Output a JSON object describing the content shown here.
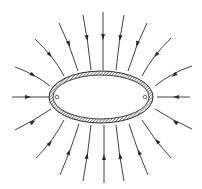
{
  "diagram": {
    "ellipse": {
      "cx": 101,
      "cy": 97,
      "rx": 52,
      "ry": 26,
      "shell_thickness": 4,
      "fill": "hatched"
    },
    "markers": [
      {
        "name": "left-point",
        "x": 57,
        "y": 97
      },
      {
        "name": "right-point",
        "x": 145,
        "y": 97
      }
    ],
    "field_lines": [
      {
        "name": "top-1",
        "d": "M15 67 Q35 74 50 86",
        "arrow": [
          33,
          75,
          35
        ]
      },
      {
        "name": "top-2",
        "d": "M35 39 Q55 58 64 76",
        "arrow": [
          50,
          55,
          50
        ]
      },
      {
        "name": "top-3",
        "d": "M59 23 Q70 45 78 71",
        "arrow": [
          69,
          44,
          68
        ]
      },
      {
        "name": "top-4",
        "d": "M83 15 Q88 40 91 70",
        "arrow": [
          87,
          38,
          80
        ]
      },
      {
        "name": "top-5",
        "d": "M103 12 L103 70",
        "arrow": [
          103,
          37,
          90
        ]
      },
      {
        "name": "top-6",
        "d": "M124 15 Q119 40 116 70",
        "arrow": [
          120,
          38,
          100
        ]
      },
      {
        "name": "top-7",
        "d": "M147 23 Q136 45 128 71",
        "arrow": [
          137,
          44,
          112
        ]
      },
      {
        "name": "top-8",
        "d": "M171 38 Q151 58 142 76",
        "arrow": [
          156,
          55,
          130
        ]
      },
      {
        "name": "top-9",
        "d": "M192 66 Q171 73 155 86",
        "arrow": [
          174,
          75,
          145
        ]
      },
      {
        "name": "left-mid",
        "d": "M12 97 L49 97",
        "arrow": [
          28,
          97,
          0
        ]
      },
      {
        "name": "right-mid",
        "d": "M190 97 L157 97",
        "arrow": [
          176,
          97,
          180
        ]
      },
      {
        "name": "bot-1",
        "d": "M15 130 Q35 120 51 109",
        "arrow": [
          33,
          122,
          -35
        ]
      },
      {
        "name": "bot-2",
        "d": "M36 158 Q54 140 64 120",
        "arrow": [
          50,
          143,
          -50
        ]
      },
      {
        "name": "bot-3",
        "d": "M60 175 Q71 150 79 124",
        "arrow": [
          69,
          152,
          -68
        ]
      },
      {
        "name": "bot-4",
        "d": "M83 181 Q88 155 91 125",
        "arrow": [
          87,
          156,
          -80
        ]
      },
      {
        "name": "bot-5",
        "d": "M104 183 L104 125",
        "arrow": [
          104,
          157,
          -90
        ]
      },
      {
        "name": "bot-6",
        "d": "M124 181 Q119 155 116 125",
        "arrow": [
          120,
          156,
          -100
        ]
      },
      {
        "name": "bot-7",
        "d": "M148 175 Q137 150 129 124",
        "arrow": [
          139,
          152,
          -112
        ]
      },
      {
        "name": "bot-8",
        "d": "M171 158 Q154 140 142 120",
        "arrow": [
          157,
          141,
          -130
        ]
      },
      {
        "name": "bot-9",
        "d": "M192 129 Q172 120 155 109",
        "arrow": [
          175,
          122,
          -145
        ]
      }
    ],
    "colors": {
      "line": "#2a2a2a",
      "background": "#ffffff",
      "hatch": "#2a2a2a"
    }
  }
}
